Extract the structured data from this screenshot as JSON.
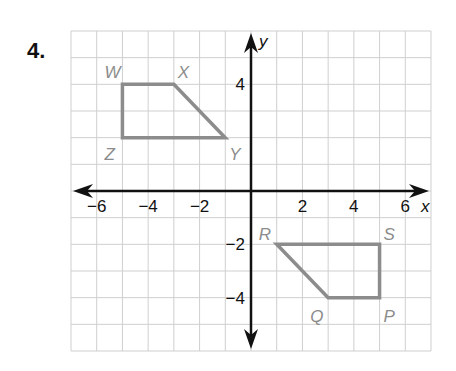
{
  "problem": {
    "number": "4."
  },
  "chart_data": {
    "type": "scatter",
    "title": "",
    "xlabel": "x",
    "ylabel": "y",
    "xlim": [
      -7,
      7
    ],
    "ylim": [
      -6,
      6
    ],
    "grid": true,
    "x_ticks": [
      {
        "v": -6,
        "label": "−6"
      },
      {
        "v": -4,
        "label": "−4"
      },
      {
        "v": -2,
        "label": "−2"
      },
      {
        "v": 2,
        "label": "2"
      },
      {
        "v": 4,
        "label": "4"
      },
      {
        "v": 6,
        "label": "6"
      }
    ],
    "y_ticks": [
      {
        "v": 4,
        "label": "4"
      },
      {
        "v": -2,
        "label": "−2"
      },
      {
        "v": -4,
        "label": "−4"
      }
    ],
    "series": [
      {
        "name": "WXYZ",
        "points": [
          {
            "label": "W",
            "x": -5,
            "y": 4,
            "dx": -18,
            "dy": -6
          },
          {
            "label": "X",
            "x": -3,
            "y": 4,
            "dx": 4,
            "dy": -6
          },
          {
            "label": "Y",
            "x": -1,
            "y": 2,
            "dx": 4,
            "dy": 22
          },
          {
            "label": "Z",
            "x": -5,
            "y": 2,
            "dx": -18,
            "dy": 22
          }
        ]
      },
      {
        "name": "PQRS",
        "points": [
          {
            "label": "R",
            "x": 1,
            "y": -2,
            "dx": -18,
            "dy": -4
          },
          {
            "label": "S",
            "x": 5,
            "y": -2,
            "dx": 4,
            "dy": -4
          },
          {
            "label": "P",
            "x": 5,
            "y": -4,
            "dx": 4,
            "dy": 24
          },
          {
            "label": "Q",
            "x": 3,
            "y": -4,
            "dx": -18,
            "dy": 24
          }
        ]
      }
    ],
    "colors": {
      "grid": "#cfcfcf",
      "axis": "#111111",
      "shape": "#8c8c8c",
      "label": "#8c8c8c"
    }
  }
}
